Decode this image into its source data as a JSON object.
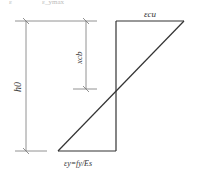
{
  "diagram": {
    "type": "strain distribution (balanced failure)",
    "top_cut_text": {
      "left": "ε",
      "right": "ε_ymax"
    },
    "labels": {
      "top_strain": "εcu",
      "effective_depth": "h0",
      "neutral_axis_depth": "xcb",
      "bottom_strain": "εy=fy/Es"
    },
    "colors": {
      "line": "#333333",
      "dim_line": "#777777",
      "text": "#333333"
    }
  }
}
